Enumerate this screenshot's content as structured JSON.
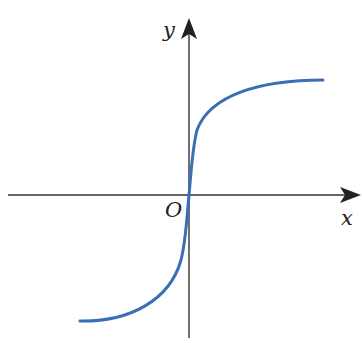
{
  "diagram": {
    "type": "function-graph",
    "axes": {
      "x_label": "x",
      "y_label": "y",
      "origin_label": "O"
    },
    "curve": {
      "color": "#3a6fb5",
      "description": "odd increasing S-shaped curve through origin, horizontal asymptotes above and below"
    },
    "axis_color": "#333333"
  }
}
